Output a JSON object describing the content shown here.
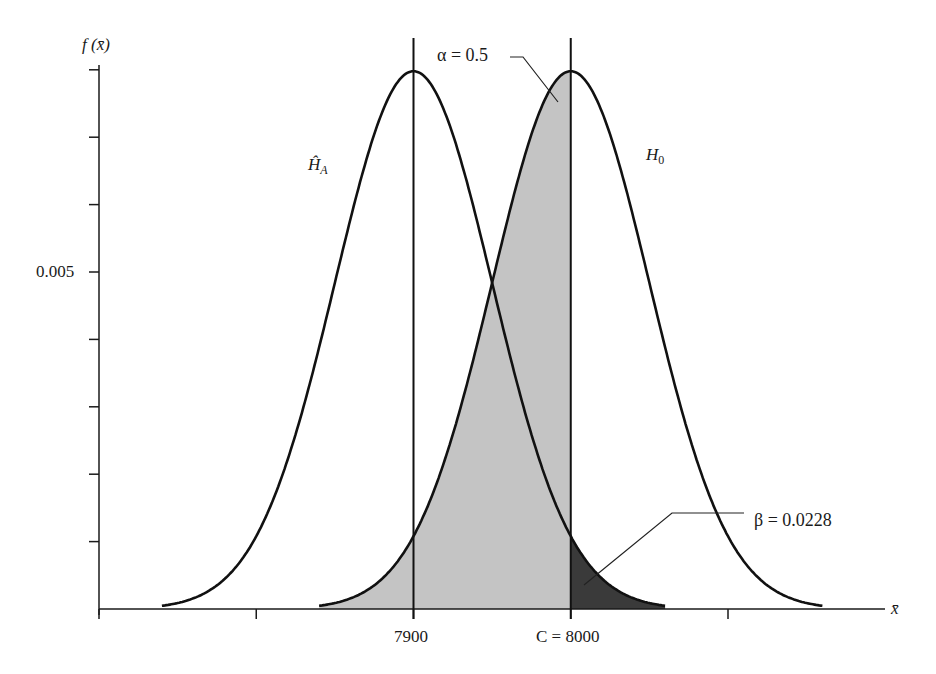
{
  "chart_data": {
    "type": "area",
    "title": "",
    "xlabel": "x̄",
    "ylabel": "f (x̄)",
    "y_ticks": [
      {
        "value": 0.005,
        "label": "0.005"
      }
    ],
    "y_tick_step": 0.001,
    "x_ticks": [
      {
        "value": 7900,
        "label": "7900"
      },
      {
        "value": 8000,
        "label": "C = 8000"
      }
    ],
    "x_tick_step": 100,
    "series": [
      {
        "name": "Ĥ_A",
        "distribution": "normal",
        "mean": 7900,
        "sd": 50
      },
      {
        "name": "H_0",
        "distribution": "normal",
        "mean": 8000,
        "sd": 50
      }
    ],
    "critical_value": 8000,
    "shaded_regions": [
      {
        "name": "alpha",
        "label": "α = 0.5",
        "value": 0.5,
        "curve": "H_0",
        "from": 7840,
        "to": 8000,
        "color": "#c4c4c4"
      },
      {
        "name": "beta",
        "label": "β = 0.0228",
        "value": 0.0228,
        "curve": "Ĥ_A",
        "from": 8000,
        "to": 8060,
        "color": "#3a3a3a"
      }
    ],
    "vertical_lines": [
      7900,
      8000
    ],
    "grid": false
  },
  "labels": {
    "y_axis": "f (x̄)",
    "x_axis": "x̄",
    "y_tick": "0.005",
    "x_tick_1": "7900",
    "x_tick_2": "C = 8000",
    "alpha": "α = 0.5",
    "beta": "β = 0.0228",
    "h_a": "Ĥ",
    "h_a_sub": "A",
    "h_0": "H",
    "h_0_sub": "0"
  }
}
